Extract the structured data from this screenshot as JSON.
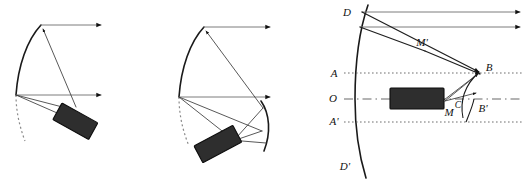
{
  "figure": {
    "caption": "",
    "background_color": "#ffffff",
    "width": 525,
    "height": 184
  },
  "colors": {
    "mirror_stroke": "#1a1a1a",
    "ray_thin": "#3a3a3a",
    "ray_medium": "#1f1f1f",
    "ray_gray": "#7d7d7d",
    "axis_dotted": "#5d5d5d",
    "axis_dashdot": "#9a9a9a",
    "receiver_fill": "#2e2e2e",
    "receiver_stroke": "#0d0d0d",
    "label_color": "#111111"
  },
  "panels": [
    {
      "id": "panel-left",
      "name": "panel-a-single-reflection",
      "labels": [],
      "elements": {
        "mirror": "concave-parabolic-arc",
        "mirror_dashed_extension": true,
        "receiver": "tilted-dark-rectangle",
        "receiver_tilt_deg": 30,
        "incoming_rays": 2,
        "ray_direction": "left-to-right-horizontal",
        "reflected_rays": 2
      }
    },
    {
      "id": "panel-middle",
      "name": "panel-b-double-reflection",
      "labels": [],
      "elements": {
        "mirror": "concave-parabolic-arc",
        "mirror_dashed_extension": true,
        "secondary_mirror": "convex-arc",
        "receiver": "tilted-dark-rectangle",
        "receiver_tilt_deg": 28,
        "incoming_rays": 2,
        "ray_direction": "left-to-right-horizontal",
        "reflected_rays": 4
      }
    },
    {
      "id": "panel-right",
      "name": "panel-c-labelled-geometry",
      "labels": [
        {
          "name": "point-D",
          "text": "D",
          "x": 347,
          "y": 13
        },
        {
          "name": "point-M-prime",
          "text": "M'",
          "x": 422,
          "y": 43
        },
        {
          "name": "point-B",
          "text": "B",
          "x": 489,
          "y": 68
        },
        {
          "name": "point-A",
          "text": "A",
          "x": 334,
          "y": 74
        },
        {
          "name": "point-O",
          "text": "O",
          "x": 333,
          "y": 99
        },
        {
          "name": "point-M",
          "text": "M",
          "x": 449,
          "y": 113
        },
        {
          "name": "point-C",
          "text": "C",
          "x": 458,
          "y": 106
        },
        {
          "name": "point-B-prime",
          "text": "B'",
          "x": 483,
          "y": 109
        },
        {
          "name": "point-A-prime",
          "text": "A'",
          "x": 334,
          "y": 122
        },
        {
          "name": "point-D-prime",
          "text": "D'",
          "x": 345,
          "y": 167
        }
      ],
      "elements": {
        "mirror": "concave-parabolic-arc-D-to-D-prime",
        "optical_axis": "O-horizontal-dash-dot",
        "aperture_line_upper": "A-dotted-horizontal",
        "aperture_line_lower": "A-prime-dotted-horizontal",
        "receiver": "horizontal-dark-rectangle",
        "incoming_rays": 2,
        "ray_direction": "left-to-right-horizontal",
        "focal_point": "B",
        "angle_marker": "C"
      }
    }
  ]
}
